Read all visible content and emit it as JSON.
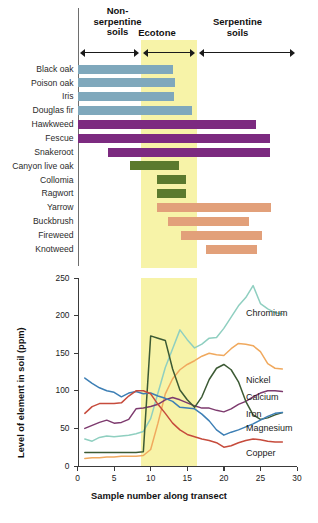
{
  "figure": {
    "zones": [
      {
        "name": "non-serpentine",
        "label": "Non-\nserpentine\nsoils",
        "x_start": 0.0,
        "x_end": 8.7
      },
      {
        "name": "ecotone",
        "label": "Ecotone",
        "x_start": 8.7,
        "x_end": 16.3
      },
      {
        "name": "serpentine",
        "label": "Serpentine\nsoils",
        "x_start": 16.3,
        "x_end": 30.0
      }
    ],
    "zone_band_color": "#f7f3a8"
  },
  "species_chart": {
    "type": "bar",
    "title": "",
    "xlabel": "",
    "ylabel": "",
    "xlim": [
      0,
      30
    ],
    "group_colors": {
      "non-serpentine": "#7fa8bc",
      "broad": "#7c2a80",
      "ecotone": "#5b7a2e",
      "serpentine": "#e2a07a"
    },
    "species": [
      {
        "name": "Black oak",
        "start": 0.0,
        "end": 13.0,
        "color_key": "non-serpentine"
      },
      {
        "name": "Poison oak",
        "start": 0.0,
        "end": 13.3,
        "color_key": "non-serpentine"
      },
      {
        "name": "Iris",
        "start": 0.0,
        "end": 13.2,
        "color_key": "non-serpentine"
      },
      {
        "name": "Douglas fir",
        "start": 0.0,
        "end": 15.6,
        "color_key": "non-serpentine"
      },
      {
        "name": "Hawkweed",
        "start": 0.0,
        "end": 24.4,
        "color_key": "broad"
      },
      {
        "name": "Fescue",
        "start": 0.0,
        "end": 26.3,
        "color_key": "broad"
      },
      {
        "name": "Snakeroot",
        "start": 4.2,
        "end": 26.3,
        "color_key": "broad"
      },
      {
        "name": "Canyon live oak",
        "start": 7.2,
        "end": 13.9,
        "color_key": "ecotone"
      },
      {
        "name": "Collomia",
        "start": 10.9,
        "end": 14.8,
        "color_key": "ecotone"
      },
      {
        "name": "Ragwort",
        "start": 10.9,
        "end": 14.8,
        "color_key": "ecotone"
      },
      {
        "name": "Yarrow",
        "start": 10.9,
        "end": 26.4,
        "color_key": "serpentine"
      },
      {
        "name": "Buckbrush",
        "start": 12.4,
        "end": 23.4,
        "color_key": "serpentine"
      },
      {
        "name": "Fireweed",
        "start": 14.1,
        "end": 25.2,
        "color_key": "serpentine"
      },
      {
        "name": "Knotweed",
        "start": 17.6,
        "end": 24.6,
        "color_key": "serpentine"
      }
    ]
  },
  "chart_data": {
    "type": "line",
    "title": "",
    "xlabel": "Sample number along transect",
    "ylabel": "Level of element in soil (ppm)",
    "xlim": [
      0,
      30
    ],
    "ylim": [
      0,
      250
    ],
    "xticks": [
      0,
      5,
      10,
      15,
      20,
      25,
      30
    ],
    "yticks": [
      0,
      50,
      100,
      150,
      200,
      250
    ],
    "grid": false,
    "legend_position": "right-inline",
    "annotations": [
      {
        "text": "Ecotone band",
        "x_start": 8.7,
        "x_end": 16.3,
        "color": "#f7f3a8"
      }
    ],
    "x": [
      1,
      2,
      3,
      4,
      5,
      6,
      7,
      8,
      9,
      10,
      11,
      12,
      13,
      14,
      15,
      16,
      17,
      18,
      19,
      20,
      21,
      22,
      23,
      24,
      25,
      26,
      27,
      28
    ],
    "series": [
      {
        "name": "Chromium",
        "color": "#8fcfc0",
        "values": [
          36,
          33,
          38,
          40,
          39,
          40,
          41,
          43,
          46,
          63,
          97,
          131,
          156,
          181,
          168,
          157,
          162,
          170,
          171,
          183,
          198,
          213,
          224,
          240,
          216,
          209,
          204,
          202
        ]
      },
      {
        "name": "Nickel",
        "color": "#f0a95e",
        "values": [
          10,
          11,
          11,
          12,
          12,
          13,
          13,
          13,
          14,
          22,
          57,
          96,
          116,
          128,
          135,
          140,
          146,
          150,
          148,
          147,
          156,
          163,
          162,
          160,
          152,
          136,
          130,
          129
        ]
      },
      {
        "name": "Calcium",
        "color": "#7d3a6e",
        "values": [
          50,
          54,
          58,
          61,
          57,
          58,
          62,
          76,
          77,
          79,
          82,
          88,
          91,
          88,
          84,
          80,
          77,
          77,
          74,
          72,
          76,
          82,
          86,
          92,
          97,
          100,
          100,
          99
        ]
      },
      {
        "name": "Iron",
        "color": "#3c5a34",
        "values": [
          18,
          18,
          18,
          18,
          18,
          18,
          18,
          18,
          19,
          173,
          170,
          167,
          129,
          101,
          88,
          78,
          92,
          115,
          130,
          135,
          128,
          112,
          86,
          68,
          62,
          64,
          68,
          71
        ]
      },
      {
        "name": "Magnesium",
        "color": "#3d7fb5",
        "values": [
          117,
          110,
          104,
          100,
          98,
          92,
          97,
          99,
          96,
          97,
          93,
          90,
          86,
          78,
          77,
          76,
          69,
          60,
          48,
          41,
          45,
          48,
          52,
          56,
          61,
          66,
          70,
          71
        ]
      },
      {
        "name": "Copper",
        "color": "#c64b3c",
        "values": [
          70,
          79,
          83,
          83,
          83,
          84,
          93,
          100,
          100,
          96,
          82,
          70,
          57,
          48,
          42,
          39,
          36,
          34,
          31,
          25,
          27,
          31,
          34,
          36,
          35,
          33,
          32,
          32
        ]
      }
    ]
  }
}
